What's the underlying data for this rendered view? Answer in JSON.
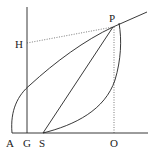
{
  "diagram": {
    "type": "geometric-construction",
    "labels": {
      "A": "A",
      "G": "G",
      "S": "S",
      "O": "O",
      "P": "P",
      "H": "H"
    },
    "colors": {
      "stroke": "#222222",
      "background": "#ffffff"
    }
  }
}
